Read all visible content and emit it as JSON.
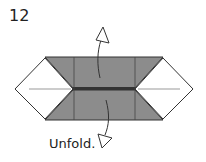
{
  "diagram": {
    "step_number": "12",
    "instruction": "Unfold.",
    "colors": {
      "paper_colored": "#8c8c8c",
      "paper_white": "#ffffff",
      "outline": "#333333",
      "crease": "#999999"
    }
  }
}
